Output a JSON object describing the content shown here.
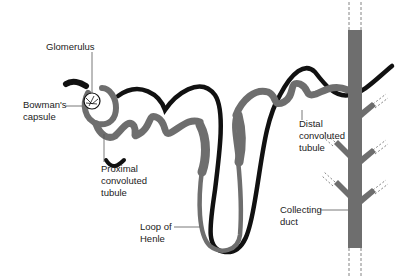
{
  "labels": {
    "glomerulus": "Glomerulus",
    "bowmans_capsule": [
      "Bowman's",
      "capsule"
    ],
    "proximal_tubule": [
      "Proximal",
      "convoluted",
      "tubule"
    ],
    "loop_of_henle": [
      "Loop of",
      "Henle"
    ],
    "distal_tubule": [
      "Distal",
      "convoluted",
      "tubule"
    ],
    "collecting_duct": [
      "Collecting",
      "duct"
    ]
  },
  "colors": {
    "tubule": "#6e6e6e",
    "vessel": "#111111",
    "line": "#555555"
  }
}
